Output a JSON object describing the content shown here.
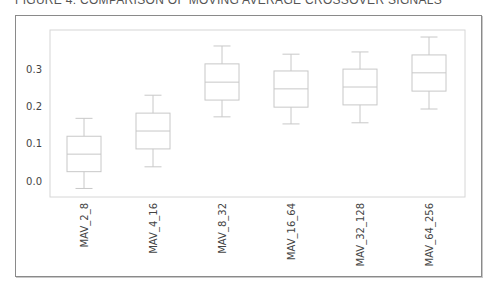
{
  "figure": {
    "title": "FIGURE 4: COMPARISON OF MOVING AVERAGE CROSSOVER SIGNALS"
  },
  "colors": {
    "box": "#c8c8c8",
    "median": "#c8c8c8",
    "axes": "#d6d6d6",
    "tick_label": "#444444",
    "frame": "#8a8a8a"
  },
  "chart_data": {
    "type": "boxplot",
    "title": "FIGURE 4: COMPARISON OF MOVING AVERAGE CROSSOVER SIGNALS",
    "xlabel": "",
    "ylabel": "",
    "categories": [
      "MAV_2_8",
      "MAV_4_16",
      "MAV_8_32",
      "MAV_16_64",
      "MAV_32_128",
      "MAV_64_256"
    ],
    "series": [
      {
        "name": "MAV_2_8",
        "whisker_low": -0.02,
        "q1": 0.025,
        "median": 0.072,
        "q3": 0.12,
        "whisker_high": 0.168
      },
      {
        "name": "MAV_4_16",
        "whisker_low": 0.038,
        "q1": 0.086,
        "median": 0.134,
        "q3": 0.182,
        "whisker_high": 0.23
      },
      {
        "name": "MAV_8_32",
        "whisker_low": 0.172,
        "q1": 0.217,
        "median": 0.265,
        "q3": 0.314,
        "whisker_high": 0.362
      },
      {
        "name": "MAV_16_64",
        "whisker_low": 0.153,
        "q1": 0.198,
        "median": 0.247,
        "q3": 0.295,
        "whisker_high": 0.34
      },
      {
        "name": "MAV_32_128",
        "whisker_low": 0.156,
        "q1": 0.204,
        "median": 0.252,
        "q3": 0.3,
        "whisker_high": 0.346
      },
      {
        "name": "MAV_64_256",
        "whisker_low": 0.193,
        "q1": 0.241,
        "median": 0.29,
        "q3": 0.338,
        "whisker_high": 0.386
      }
    ],
    "yticks": [
      0.0,
      0.1,
      0.2,
      0.3
    ],
    "ytick_labels": [
      "0.0",
      "0.1",
      "0.2",
      "0.3"
    ],
    "ylim": [
      -0.045,
      0.405
    ],
    "grid": false,
    "legend": null,
    "xtick_rotation": 90
  }
}
